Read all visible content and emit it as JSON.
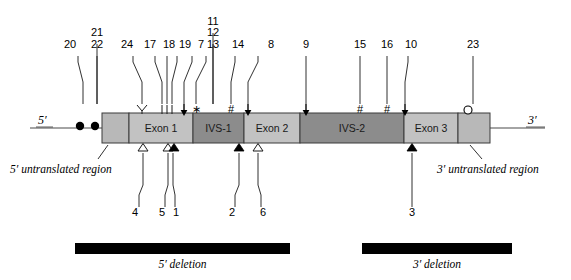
{
  "figure": {
    "title_absent": true,
    "end_labels": {
      "five_prime": "5′",
      "three_prime": "3′"
    },
    "region_captions": {
      "five_utr": "5′ untranslated region",
      "three_utr": "3′ untranslated region"
    },
    "deletions": [
      {
        "id": "five-deletion",
        "label": "5′ deletion",
        "x1": 75,
        "x2": 290,
        "y": 243,
        "height": 11
      },
      {
        "id": "three-deletion",
        "label": "3′ deletion",
        "x1": 362,
        "x2": 512,
        "y": 243,
        "height": 11
      }
    ]
  },
  "gene": {
    "bar_x": 102,
    "bar_y": 113,
    "bar_w": 388,
    "bar_h": 30,
    "segments": [
      {
        "name": "five-utr-block",
        "label": "",
        "x": 102,
        "w": 27,
        "fill": "#b8b8b8"
      },
      {
        "name": "exon-1",
        "label": "Exon 1",
        "x": 129,
        "w": 64,
        "fill": "#c2c2c2"
      },
      {
        "name": "ivs-1",
        "label": "IVS-1",
        "x": 193,
        "w": 51,
        "fill": "#8c8c8c"
      },
      {
        "name": "exon-2",
        "label": "Exon 2",
        "x": 244,
        "w": 56,
        "fill": "#c2c2c2"
      },
      {
        "name": "ivs-2",
        "label": "IVS-2",
        "x": 300,
        "w": 104,
        "fill": "#8c8c8c"
      },
      {
        "name": "exon-3",
        "label": "Exon 3",
        "x": 404,
        "w": 54,
        "fill": "#c2c2c2"
      },
      {
        "name": "three-utr-block",
        "label": "",
        "x": 458,
        "w": 32,
        "fill": "#b8b8b8"
      }
    ],
    "flank_left": {
      "x1": 30,
      "x2": 102,
      "y": 128
    },
    "flank_right": {
      "x1": 490,
      "x2": 545,
      "y": 128
    },
    "cap_dots": [
      {
        "name": "cap-dot-1",
        "cx": 80,
        "cy": 126,
        "r": 4.2
      },
      {
        "name": "cap-dot-2",
        "cx": 95,
        "cy": 126,
        "r": 4.2
      }
    ],
    "poly_a_circle": {
      "name": "poly-a-circle",
      "cx": 468,
      "cy": 110,
      "r": 4
    }
  },
  "top_labels": [
    {
      "num": "20",
      "tx": 70,
      "ty": 48,
      "px": 83,
      "kx": 78
    },
    {
      "num": "21",
      "tx": 97,
      "ty": 36,
      "px": 97,
      "kx": 97
    },
    {
      "num": "22",
      "tx": 97,
      "ty": 48,
      "px": 97,
      "kx": 97
    },
    {
      "num": "24",
      "tx": 127,
      "ty": 48,
      "px": 142,
      "kx": 133
    },
    {
      "num": "17",
      "tx": 150,
      "ty": 48,
      "px": 162,
      "kx": 155
    },
    {
      "num": "18",
      "tx": 169,
      "ty": 48,
      "px": 167,
      "kx": 167
    },
    {
      "num": "19",
      "tx": 185,
      "ty": 48,
      "px": 172,
      "kx": 177
    },
    {
      "num": "7",
      "tx": 201,
      "ty": 48,
      "px": 184,
      "kx": 192
    },
    {
      "num": "11",
      "tx": 213,
      "ty": 25,
      "px": 213,
      "kx": 213
    },
    {
      "num": "12",
      "tx": 213,
      "ty": 36,
      "px": 213,
      "kx": 213
    },
    {
      "num": "13",
      "tx": 213,
      "ty": 48,
      "px": 196,
      "kx": 206
    },
    {
      "num": "14",
      "tx": 238,
      "ty": 48,
      "px": 231,
      "kx": 235
    },
    {
      "num": "8",
      "tx": 271,
      "ty": 48,
      "px": 248,
      "kx": 258
    },
    {
      "num": "9",
      "tx": 306,
      "ty": 48,
      "px": 306,
      "kx": 306
    },
    {
      "num": "15",
      "tx": 360,
      "ty": 48,
      "px": 360,
      "kx": 360
    },
    {
      "num": "16",
      "tx": 387,
      "ty": 48,
      "px": 387,
      "kx": 387
    },
    {
      "num": "10",
      "tx": 411,
      "ty": 48,
      "px": 405,
      "kx": 408
    },
    {
      "num": "23",
      "tx": 473,
      "ty": 48,
      "px": 473,
      "kx": 473
    }
  ],
  "bottom_labels": [
    {
      "num": "4",
      "tx": 135,
      "ty": 216,
      "px": 143,
      "kx": 139
    },
    {
      "num": "5",
      "tx": 162,
      "ty": 216,
      "px": 168,
      "kx": 165
    },
    {
      "num": "1",
      "tx": 176,
      "ty": 216,
      "px": 173,
      "kx": 175
    },
    {
      "num": "2",
      "tx": 232,
      "ty": 216,
      "px": 239,
      "kx": 235
    },
    {
      "num": "6",
      "tx": 263,
      "ty": 216,
      "px": 258,
      "kx": 261
    },
    {
      "num": "3",
      "tx": 412,
      "ty": 216,
      "px": 412,
      "kx": 412
    }
  ],
  "top_markers": [
    {
      "name": "y-marker-24",
      "glyph": "Y",
      "x": 142,
      "y": 109
    },
    {
      "name": "tick-17",
      "glyph": "line",
      "x": 162,
      "y": 109
    },
    {
      "name": "tick-18",
      "glyph": "line",
      "x": 167,
      "y": 109
    },
    {
      "name": "tick-19",
      "glyph": "line",
      "x": 172,
      "y": 109
    },
    {
      "name": "arrow-7",
      "glyph": "arrow",
      "x": 184,
      "y": 109
    },
    {
      "name": "asterisk-13",
      "glyph": "asterisk",
      "x": 196,
      "y": 109
    },
    {
      "name": "hash-14",
      "glyph": "hash",
      "x": 231,
      "y": 109
    },
    {
      "name": "arrow-8",
      "glyph": "arrow",
      "x": 248,
      "y": 109
    },
    {
      "name": "arrow-9",
      "glyph": "arrow",
      "x": 306,
      "y": 109
    },
    {
      "name": "hash-15",
      "glyph": "hash",
      "x": 360,
      "y": 109
    },
    {
      "name": "hash-16",
      "glyph": "hash",
      "x": 387,
      "y": 109
    },
    {
      "name": "arrow-10",
      "glyph": "arrow",
      "x": 405,
      "y": 109
    }
  ],
  "bottom_markers": [
    {
      "name": "triangle-open-4",
      "glyph": "triangle-open",
      "x": 143,
      "y": 144
    },
    {
      "name": "triangle-open-5",
      "glyph": "triangle-open",
      "x": 168,
      "y": 144
    },
    {
      "name": "triangle-filled-1",
      "glyph": "triangle-filled",
      "x": 174,
      "y": 144
    },
    {
      "name": "triangle-filled-2",
      "glyph": "triangle-filled",
      "x": 239,
      "y": 144
    },
    {
      "name": "triangle-open-6",
      "glyph": "triangle-open",
      "x": 258,
      "y": 144
    },
    {
      "name": "triangle-filled-3",
      "glyph": "triangle-filled",
      "x": 412,
      "y": 144
    }
  ],
  "chart_data": {
    "type": "diagram",
    "axis": "linear gene coordinate (5′ to 3′)",
    "segments": [
      "5′ untranslated region",
      "Exon 1",
      "IVS-1",
      "Exon 2",
      "IVS-2",
      "Exon 3",
      "3′ untranslated region"
    ],
    "mutations_above": [
      "20",
      "21",
      "22",
      "24",
      "17",
      "18",
      "19",
      "7",
      "11",
      "12",
      "13",
      "14",
      "8",
      "9",
      "15",
      "16",
      "10",
      "23"
    ],
    "mutations_below": [
      "4",
      "5",
      "1",
      "2",
      "6",
      "3"
    ],
    "deletion_spans": [
      "5′ deletion",
      "3′ deletion"
    ]
  }
}
